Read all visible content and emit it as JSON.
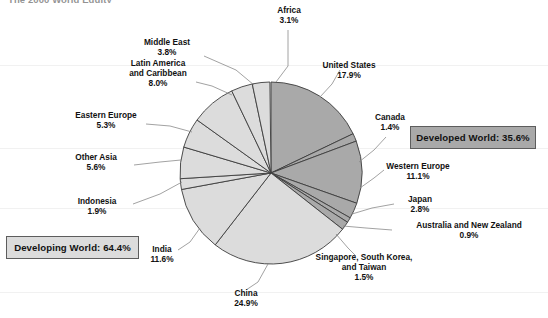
{
  "title_clipped": "The 2000 World Equity",
  "summary": {
    "developed": {
      "label": "Developed World: 35.6%",
      "value": 35.6,
      "color": "#a9a9a9"
    },
    "developing": {
      "label": "Developing World: 64.4%",
      "value": 64.4,
      "color": "#dcdcdc"
    }
  },
  "chart_data": {
    "type": "pie",
    "title": "The 2000 World Equity",
    "units": "percent",
    "start_angle_deg": 0,
    "direction": "clockwise",
    "total": 100.0,
    "groups": [
      {
        "name": "Developed World",
        "value": 35.6,
        "color": "#a9a9a9"
      },
      {
        "name": "Developing World",
        "value": 64.4,
        "color": "#dcdcdc"
      }
    ],
    "categories": [
      "United States",
      "Canada",
      "Western Europe",
      "Japan",
      "Australia and New Zealand",
      "Singapore, South Korea, and Taiwan",
      "China",
      "India",
      "Indonesia",
      "Other Asia",
      "Eastern Europe",
      "Latin America and Caribbean",
      "Middle East",
      "Africa"
    ],
    "values": [
      17.9,
      1.4,
      11.1,
      2.8,
      0.9,
      1.5,
      24.9,
      11.6,
      1.9,
      5.6,
      5.3,
      8.0,
      3.8,
      3.1
    ],
    "slices": [
      {
        "label": "United States",
        "pct": "17.9%",
        "value": 17.9,
        "group": "Developed World",
        "color": "#a9a9a9"
      },
      {
        "label": "Canada",
        "pct": "1.4%",
        "value": 1.4,
        "group": "Developed World",
        "color": "#a9a9a9"
      },
      {
        "label": "Western Europe",
        "pct": "11.1%",
        "value": 11.1,
        "group": "Developed World",
        "color": "#a9a9a9"
      },
      {
        "label": "Japan",
        "pct": "2.8%",
        "value": 2.8,
        "group": "Developed World",
        "color": "#a9a9a9"
      },
      {
        "label": "Australia and New Zealand",
        "pct": "0.9%",
        "value": 0.9,
        "group": "Developed World",
        "color": "#a9a9a9"
      },
      {
        "label": "Singapore, South Korea, and Taiwan",
        "pct": "1.5%",
        "value": 1.5,
        "group": "Developed World",
        "color": "#a9a9a9"
      },
      {
        "label": "China",
        "pct": "24.9%",
        "value": 24.9,
        "group": "Developing World",
        "color": "#dcdcdc"
      },
      {
        "label": "India",
        "pct": "11.6%",
        "value": 11.6,
        "group": "Developing World",
        "color": "#dcdcdc"
      },
      {
        "label": "Indonesia",
        "pct": "1.9%",
        "value": 1.9,
        "group": "Developing World",
        "color": "#dcdcdc"
      },
      {
        "label": "Other Asia",
        "pct": "5.6%",
        "value": 5.6,
        "group": "Developing World",
        "color": "#dcdcdc"
      },
      {
        "label": "Eastern Europe",
        "pct": "5.3%",
        "value": 5.3,
        "group": "Developing World",
        "color": "#dcdcdc"
      },
      {
        "label": "Latin America and Caribbean",
        "pct": "8.0%",
        "value": 8.0,
        "group": "Developing World",
        "color": "#dcdcdc"
      },
      {
        "label": "Middle East",
        "pct": "3.8%",
        "value": 3.8,
        "group": "Developing World",
        "color": "#dcdcdc"
      },
      {
        "label": "Africa",
        "pct": "3.1%",
        "value": 3.1,
        "group": "Developing World",
        "color": "#dcdcdc"
      }
    ],
    "legend_position": "none",
    "grid": false
  },
  "labels": {
    "africa": {
      "name": "Africa",
      "pct": "3.1%"
    },
    "middle_east": {
      "name": "Middle East",
      "pct": "3.8%"
    },
    "latin_america_l1": "Latin America",
    "latin_america_l2": "and Caribbean",
    "latin_america_pct": "8.0%",
    "eastern_europe": {
      "name": "Eastern Europe",
      "pct": "5.3%"
    },
    "other_asia": {
      "name": "Other Asia",
      "pct": "5.6%"
    },
    "indonesia": {
      "name": "Indonesia",
      "pct": "1.9%"
    },
    "india": {
      "name": "India",
      "pct": "11.6%"
    },
    "china": {
      "name": "China",
      "pct": "24.9%"
    },
    "united_states": {
      "name": "United States",
      "pct": "17.9%"
    },
    "canada": {
      "name": "Canada",
      "pct": "1.4%"
    },
    "western_europe": {
      "name": "Western Europe",
      "pct": "11.1%"
    },
    "japan": {
      "name": "Japan",
      "pct": "2.8%"
    },
    "anz": {
      "name": "Australia and New Zealand",
      "pct": "0.9%"
    },
    "sskt_l1": "Singapore, South Korea,",
    "sskt_l2": "and Taiwan",
    "sskt_pct": "1.5%"
  }
}
